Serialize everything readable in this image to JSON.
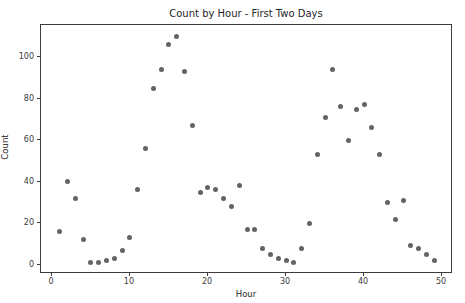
{
  "chart_data": {
    "type": "scatter",
    "title": "Count by Hour - First Two Days",
    "xlabel": "Hour",
    "ylabel": "Count",
    "x": [
      1,
      2,
      3,
      4,
      5,
      6,
      7,
      8,
      9,
      10,
      11,
      12,
      13,
      14,
      15,
      16,
      17,
      18,
      19,
      20,
      21,
      22,
      23,
      24,
      25,
      26,
      27,
      28,
      29,
      30,
      31,
      32,
      33,
      34,
      35,
      36,
      37,
      38,
      39,
      40,
      41,
      42,
      43,
      44,
      45,
      46,
      47,
      48,
      49
    ],
    "y": [
      16,
      40,
      32,
      12,
      1,
      1,
      2,
      3,
      7,
      13,
      36,
      56,
      85,
      94,
      106,
      110,
      93,
      67,
      35,
      37,
      36,
      32,
      28,
      38,
      17,
      17,
      8,
      5,
      3,
      2,
      1,
      8,
      20,
      53,
      71,
      94,
      76,
      60,
      75,
      77,
      66,
      53,
      30,
      22,
      31,
      9,
      8,
      5,
      2
    ],
    "xlim": [
      -1.4,
      51.4
    ],
    "ylim": [
      -4.5,
      115.5
    ],
    "x_ticks": [
      0,
      10,
      20,
      30,
      40,
      50
    ],
    "y_ticks": [
      0,
      20,
      40,
      60,
      80,
      100
    ],
    "grid": false,
    "legend": false,
    "marker_color": "#55555a",
    "spine_color": "#3c3c3c",
    "background_color": "#ffffff"
  }
}
